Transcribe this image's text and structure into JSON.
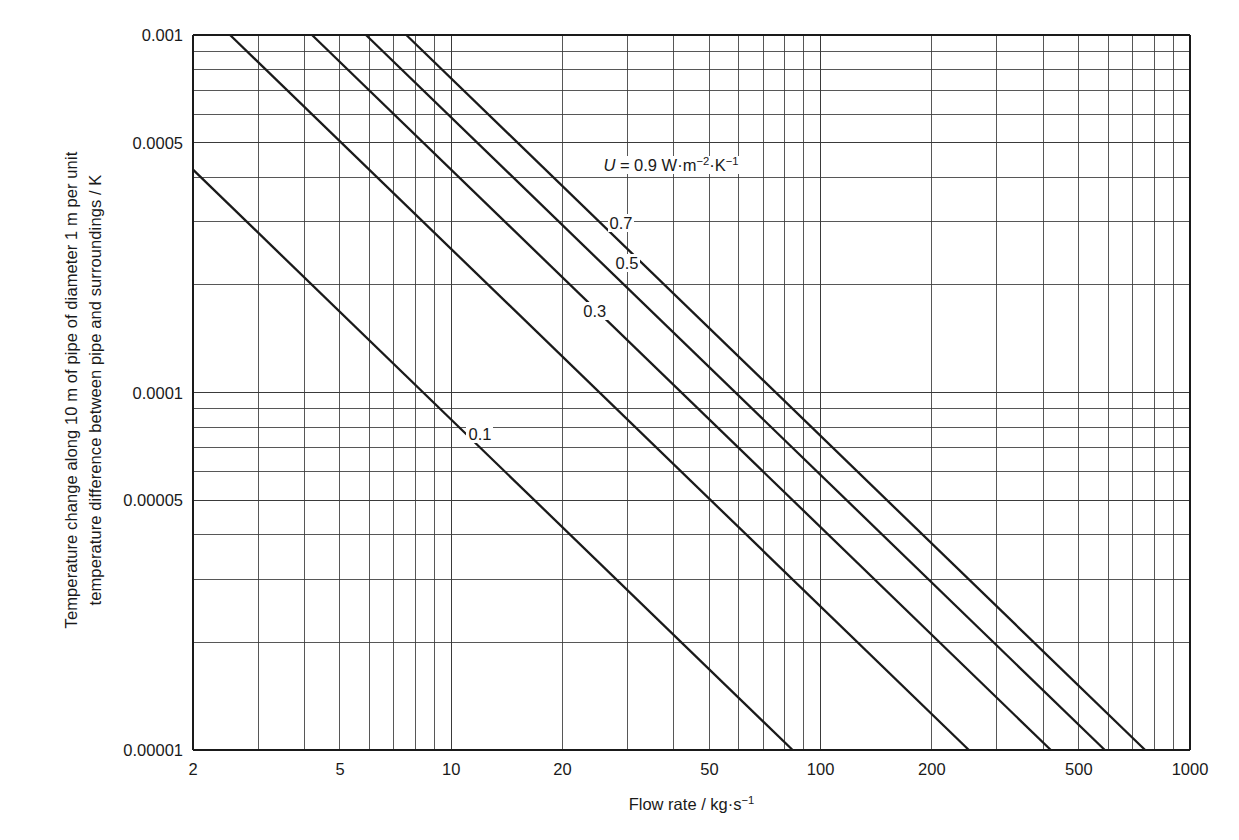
{
  "chart_data": {
    "type": "line",
    "title": "",
    "xlabel": "Flow rate / kg·s⁻¹",
    "ylabel_line1": "Temperature change along 10 m of pipe of diameter 1 m per  unit",
    "ylabel_line2": "temperature difference between pipe and surroundings / K",
    "xscale": "log",
    "yscale": "log",
    "xlim": [
      2,
      1000
    ],
    "ylim": [
      1e-05,
      0.001
    ],
    "grid": true,
    "legend_position": "inline-curve-labels",
    "xticks": [
      "2",
      "5",
      "10",
      "20",
      "50",
      "100",
      "200",
      "500",
      "1000"
    ],
    "xtick_values": [
      2,
      5,
      10,
      20,
      50,
      100,
      200,
      500,
      1000
    ],
    "yticks": [
      "0.001",
      "0.0005",
      "0.0001",
      "0.00005",
      "0.00001"
    ],
    "ytick_values": [
      0.001,
      0.0005,
      0.0001,
      5e-05,
      1e-05
    ],
    "annotation_main": "U = 0.9 W·m⁻²·K⁻¹",
    "annotation_main_symbol": "U",
    "annotation_main_rest": " = 0.9 W·m",
    "series": [
      {
        "name": "0.1",
        "label": "0.1",
        "U": 0.1,
        "slope": -1,
        "points": [
          [
            2,
            0.00042
          ],
          [
            1000,
            8.4e-07
          ]
        ]
      },
      {
        "name": "0.3",
        "label": "0.3",
        "U": 0.3,
        "slope": -1,
        "points": [
          [
            2,
            0.00126
          ],
          [
            1000,
            2.52e-06
          ]
        ]
      },
      {
        "name": "0.5",
        "label": "0.5",
        "U": 0.5,
        "slope": -1,
        "points": [
          [
            2,
            0.0021
          ],
          [
            1000,
            4.2e-06
          ]
        ]
      },
      {
        "name": "0.7",
        "label": "0.7",
        "U": 0.7,
        "slope": -1,
        "points": [
          [
            2,
            0.00294
          ],
          [
            1000,
            5.88e-06
          ]
        ]
      },
      {
        "name": "0.9",
        "label": "0.9",
        "U": 0.9,
        "slope": -1,
        "points": [
          [
            2,
            0.00378
          ],
          [
            1000,
            7.56e-06
          ]
        ]
      }
    ],
    "curve_label_positions": [
      {
        "label": "0.1",
        "x": 11.0,
        "y": 7.55e-05
      },
      {
        "label": "0.3",
        "x": 22.5,
        "y": 0.000167
      },
      {
        "label": "0.5",
        "x": 27.5,
        "y": 0.000228
      },
      {
        "label": "0.7",
        "x": 26.5,
        "y": 0.000295
      },
      {
        "label": "0.9",
        "x": 25.5,
        "y": 0.000427
      }
    ],
    "colors": {
      "curve": "#1a1a1a",
      "grid": "#3a3a3a",
      "axis": "#1a1a1a",
      "background": "#ffffff",
      "text": "#1a1a1a"
    }
  }
}
